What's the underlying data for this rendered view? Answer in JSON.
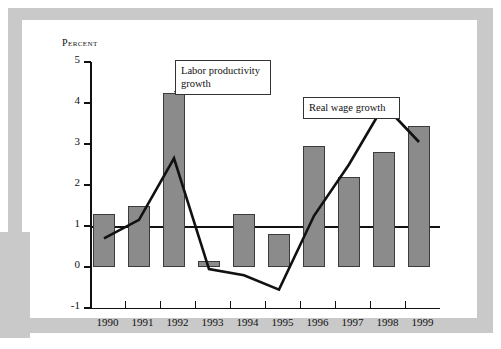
{
  "chart_data": {
    "type": "bar",
    "title": "",
    "subtitle": "",
    "xlabel": "",
    "ylabel": "Percent",
    "ylim": [
      -1,
      5
    ],
    "xlim_categories": [
      "1990",
      "1991",
      "1992",
      "1993",
      "1994",
      "1995",
      "1996",
      "1997",
      "1998",
      "1999"
    ],
    "categories": [
      "1990",
      "1991",
      "1992",
      "1993",
      "1994",
      "1995",
      "1996",
      "1997",
      "1998",
      "1999"
    ],
    "y_ticks": [
      "5",
      "4",
      "3",
      "2",
      "1",
      "0",
      "-1"
    ],
    "y_tick_values": [
      5,
      4,
      3,
      2,
      1,
      0,
      -1
    ],
    "grid": false,
    "legend_position": "annotations",
    "series": [
      {
        "name": "Labor productivity growth",
        "type": "bar",
        "color": "#8b8b8b",
        "values": [
          1.3,
          1.5,
          4.25,
          0.15,
          1.3,
          0.8,
          2.95,
          2.2,
          2.8,
          3.45
        ]
      },
      {
        "name": "Real wage growth",
        "type": "line",
        "color": "#111111",
        "values": [
          0.7,
          1.15,
          2.65,
          -0.05,
          -0.2,
          -0.55,
          1.25,
          2.5,
          3.95,
          3.05
        ]
      }
    ],
    "annotations": [
      {
        "id": "productivity",
        "text": "Labor productivity growth",
        "target_category": "1992",
        "target_series": "Labor productivity growth"
      },
      {
        "id": "wage",
        "text": "Real wage growth",
        "target_category": "1998",
        "target_series": "Real wage growth"
      }
    ]
  },
  "axis": {
    "y_title": "Percent"
  },
  "annotations": {
    "productivity_label": "Labor productivity growth",
    "wage_label": "Real wage growth"
  },
  "colors": {
    "bar_fill": "#8b8b8b",
    "bar_stroke": "#3b3b3b",
    "line": "#111111",
    "frame": "#c9c9c9",
    "background": "#ffffff"
  }
}
